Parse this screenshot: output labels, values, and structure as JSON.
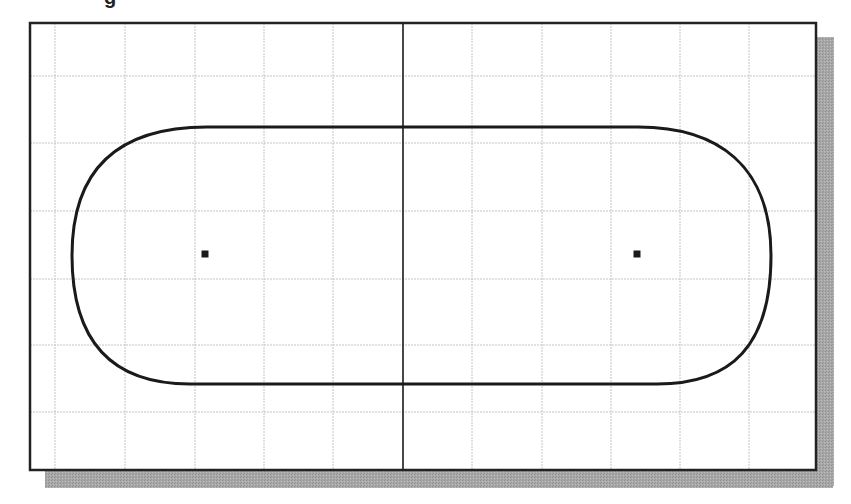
{
  "caption": {
    "partial_text": "g"
  },
  "canvas": {
    "frame": {
      "x": 30,
      "y": 23,
      "width": 786,
      "height": 447,
      "border_color": "#222222",
      "border_width": 2.5
    },
    "shadow": {
      "offset_x": 17,
      "offset_y": 17,
      "color": "#a8a8a8"
    },
    "background": "#ffffff",
    "grid": {
      "color": "#c4c4c4",
      "vertical_lines_x": [
        55,
        125,
        195,
        264,
        333,
        472,
        542,
        611,
        680,
        749
      ],
      "horizontal_lines_y": [
        76,
        143,
        211,
        279,
        345,
        412
      ]
    },
    "construction_line": {
      "x": 403,
      "color": "#1a1a1a",
      "width": 1.6
    }
  },
  "sketch": {
    "type": "slot",
    "stroke_color": "#1a1a1a",
    "stroke_width": 3,
    "top_line": {
      "x1": 207,
      "y1": 127,
      "x2": 638,
      "y2": 127
    },
    "bottom_line": {
      "x1": 190,
      "y1": 384,
      "x2": 657,
      "y2": 384
    },
    "left_extreme_x": 72,
    "right_extreme_x": 771,
    "center_points": [
      {
        "name": "left-center-point",
        "x": 205,
        "y": 254
      },
      {
        "name": "right-center-point",
        "x": 637,
        "y": 254
      }
    ]
  }
}
